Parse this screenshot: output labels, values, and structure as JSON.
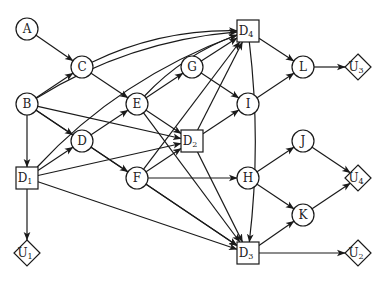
{
  "diagram": {
    "type": "influence-diagram",
    "nodes": [
      {
        "id": "A",
        "label": "A",
        "kind": "chance",
        "x": 27,
        "y": 29
      },
      {
        "id": "B",
        "label": "B",
        "kind": "chance",
        "x": 27,
        "y": 104
      },
      {
        "id": "C",
        "label": "C",
        "kind": "chance",
        "x": 82,
        "y": 67
      },
      {
        "id": "D",
        "label": "D",
        "kind": "chance",
        "x": 82,
        "y": 141
      },
      {
        "id": "E",
        "label": "E",
        "kind": "chance",
        "x": 137,
        "y": 104
      },
      {
        "id": "F",
        "label": "F",
        "kind": "chance",
        "x": 137,
        "y": 178
      },
      {
        "id": "G",
        "label": "G",
        "kind": "chance",
        "x": 192,
        "y": 67
      },
      {
        "id": "H",
        "label": "H",
        "kind": "chance",
        "x": 248,
        "y": 178
      },
      {
        "id": "I",
        "label": "I",
        "kind": "chance",
        "x": 248,
        "y": 104
      },
      {
        "id": "J",
        "label": "J",
        "kind": "chance",
        "x": 303,
        "y": 141
      },
      {
        "id": "K",
        "label": "K",
        "kind": "chance",
        "x": 303,
        "y": 215
      },
      {
        "id": "L",
        "label": "L",
        "kind": "chance",
        "x": 303,
        "y": 67
      },
      {
        "id": "D1",
        "label": "D",
        "sub": "1",
        "kind": "decision",
        "x": 27,
        "y": 178
      },
      {
        "id": "D2",
        "label": "D",
        "sub": "2",
        "kind": "decision",
        "x": 192,
        "y": 141
      },
      {
        "id": "D3",
        "label": "D",
        "sub": "3",
        "kind": "decision",
        "x": 248,
        "y": 253
      },
      {
        "id": "D4",
        "label": "D",
        "sub": "4",
        "kind": "decision",
        "x": 248,
        "y": 31
      },
      {
        "id": "U1",
        "label": "U",
        "sub": "1",
        "kind": "utility",
        "x": 27,
        "y": 253
      },
      {
        "id": "U2",
        "label": "U",
        "sub": "2",
        "kind": "utility",
        "x": 358,
        "y": 253
      },
      {
        "id": "U3",
        "label": "U",
        "sub": "3",
        "kind": "utility",
        "x": 358,
        "y": 67
      },
      {
        "id": "U4",
        "label": "U",
        "sub": "4",
        "kind": "utility",
        "x": 358,
        "y": 178
      }
    ],
    "edges": [
      {
        "from": "A",
        "to": "C"
      },
      {
        "from": "B",
        "to": "C"
      },
      {
        "from": "B",
        "to": "D"
      },
      {
        "from": "B",
        "to": "D1"
      },
      {
        "from": "B",
        "to": "D2"
      },
      {
        "from": "B",
        "to": "D3"
      },
      {
        "from": "B",
        "to": "D4",
        "curved": true
      },
      {
        "from": "C",
        "to": "E"
      },
      {
        "from": "C",
        "to": "D4",
        "curved": true
      },
      {
        "from": "D1",
        "to": "D"
      },
      {
        "from": "D1",
        "to": "U1"
      },
      {
        "from": "D1",
        "to": "D2"
      },
      {
        "from": "D1",
        "to": "D3"
      },
      {
        "from": "D1",
        "to": "D4",
        "curved": true
      },
      {
        "from": "D",
        "to": "E"
      },
      {
        "from": "D",
        "to": "F"
      },
      {
        "from": "E",
        "to": "G"
      },
      {
        "from": "E",
        "to": "D2"
      },
      {
        "from": "E",
        "to": "D3"
      },
      {
        "from": "E",
        "to": "D4",
        "curved": true
      },
      {
        "from": "G",
        "to": "D4"
      },
      {
        "from": "G",
        "to": "I"
      },
      {
        "from": "F",
        "to": "D2"
      },
      {
        "from": "F",
        "to": "H"
      },
      {
        "from": "F",
        "to": "D3"
      },
      {
        "from": "F",
        "to": "D4"
      },
      {
        "from": "D2",
        "to": "I"
      },
      {
        "from": "D2",
        "to": "D4"
      },
      {
        "from": "D2",
        "to": "D3"
      },
      {
        "from": "D4",
        "to": "L"
      },
      {
        "from": "D4",
        "to": "D3",
        "curved": true
      },
      {
        "from": "I",
        "to": "L"
      },
      {
        "from": "L",
        "to": "U3"
      },
      {
        "from": "H",
        "to": "J"
      },
      {
        "from": "H",
        "to": "K"
      },
      {
        "from": "J",
        "to": "U4"
      },
      {
        "from": "K",
        "to": "U4"
      },
      {
        "from": "D3",
        "to": "K"
      },
      {
        "from": "D3",
        "to": "U2"
      }
    ]
  },
  "colors": {
    "stroke": "#1a1a1a",
    "fill": "#ffffff",
    "text": "#222222"
  }
}
